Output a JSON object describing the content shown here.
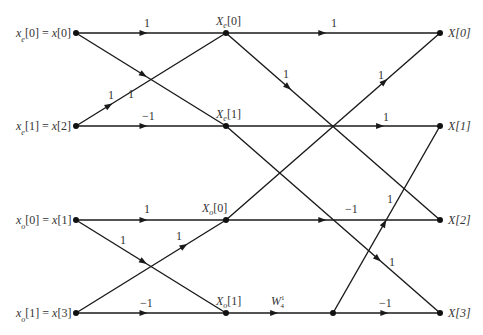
{
  "diagram": {
    "inputs": [
      {
        "name": "x_e",
        "sub": "e",
        "idx": "0",
        "eq": "x[0]"
      },
      {
        "name": "x_e",
        "sub": "e",
        "idx": "1",
        "eq": "x[2]"
      },
      {
        "name": "x_o",
        "sub": "o",
        "idx": "0",
        "eq": "x[1]"
      },
      {
        "name": "x_o",
        "sub": "o",
        "idx": "1",
        "eq": "x[3]"
      }
    ],
    "intermediate": [
      {
        "sym": "X",
        "sub": "e",
        "idx": "[0]"
      },
      {
        "sym": "X",
        "sub": "e",
        "idx": "[1]"
      },
      {
        "sym": "X",
        "sub": "o",
        "idx": "[0]"
      },
      {
        "sym": "X",
        "sub": "o",
        "idx": "[1]"
      }
    ],
    "outputs": [
      "X[0]",
      "X[1]",
      "X[2]",
      "X[3]"
    ],
    "twiddle": {
      "sym": "W",
      "sup": "1",
      "sub": "4"
    },
    "gains": {
      "s1_e_top": "1",
      "s1_e_cross1": "1",
      "s1_e_cross2": "1",
      "s1_e_bot": "−1",
      "s1_o_top": "1",
      "s1_o_cross1": "1",
      "s1_o_cross2": "1",
      "s1_o_bot": "−1",
      "s2_r0": "1",
      "s2_cross_a": "1",
      "s2_cross_b": "1",
      "s2_r1": "1",
      "s2_r2": "−1",
      "s2_cross_c": "1",
      "s2_cross_d": "1",
      "s2_r3": "−1"
    }
  }
}
